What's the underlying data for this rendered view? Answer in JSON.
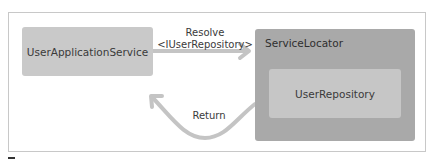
{
  "diagram": {
    "nodes": {
      "app_service": {
        "label": "UserApplicationService"
      },
      "service_locator": {
        "label": "ServiceLocator"
      },
      "repository": {
        "label": "UserRepository"
      }
    },
    "edges": {
      "resolve": {
        "line1": "Resolve",
        "line2": "<IUserRepository>",
        "from": "UserApplicationService",
        "to": "ServiceLocator"
      },
      "return": {
        "label": "Return",
        "from": "ServiceLocator",
        "to": "UserApplicationService"
      }
    },
    "colors": {
      "app_box": "#c9c9c9",
      "locator_box": "#a9a9a9",
      "repo_box": "#c6c6c6",
      "arrow": "#c4c4c4",
      "frame": "#c8c8c8"
    }
  }
}
